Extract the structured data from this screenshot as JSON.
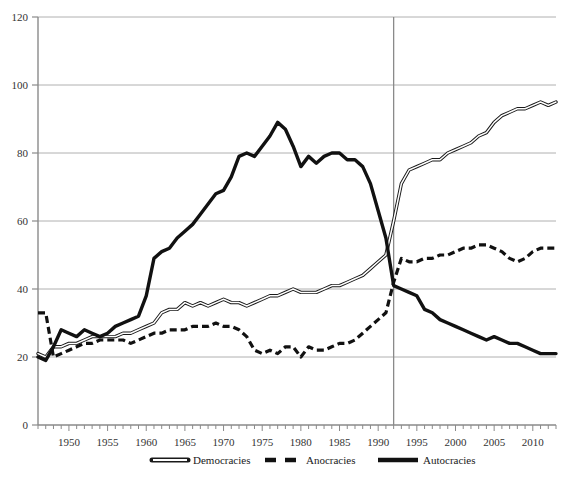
{
  "chart_data": {
    "type": "line",
    "title": "",
    "subtitle": "",
    "xlabel": "",
    "ylabel": "",
    "xlim": [
      1946,
      2013
    ],
    "ylim": [
      0,
      120
    ],
    "grid": true,
    "gridlines_y": [
      20,
      40,
      60,
      80,
      100,
      120
    ],
    "yticks": [
      0,
      20,
      40,
      60,
      80,
      100,
      120
    ],
    "ytick_labels": [
      "0",
      "20",
      "40",
      "60",
      "80",
      "100",
      "120"
    ],
    "xticks": [
      1950,
      1955,
      1960,
      1965,
      1970,
      1975,
      1980,
      1985,
      1990,
      1995,
      2000,
      2005,
      2010
    ],
    "xtick_labels": [
      "1950",
      "1955",
      "1960",
      "1965",
      "1970",
      "1975",
      "1980",
      "1985",
      "1990",
      "1995",
      "2000",
      "2005",
      "2010"
    ],
    "xtick_minor_step": 1,
    "legend_position": "bottom",
    "annotations": [
      {
        "type": "vertical-line",
        "x": 1992,
        "label": ""
      }
    ],
    "x": [
      1946,
      1947,
      1948,
      1949,
      1950,
      1951,
      1952,
      1953,
      1954,
      1955,
      1956,
      1957,
      1958,
      1959,
      1960,
      1961,
      1962,
      1963,
      1964,
      1965,
      1966,
      1967,
      1968,
      1969,
      1970,
      1971,
      1972,
      1973,
      1974,
      1975,
      1976,
      1977,
      1978,
      1979,
      1980,
      1981,
      1982,
      1983,
      1984,
      1985,
      1986,
      1987,
      1988,
      1989,
      1990,
      1991,
      1992,
      1993,
      1994,
      1995,
      1996,
      1997,
      1998,
      1999,
      2000,
      2001,
      2002,
      2003,
      2004,
      2005,
      2006,
      2007,
      2008,
      2009,
      2010,
      2011,
      2012,
      2013
    ],
    "series": [
      {
        "name": "Democracies",
        "style": "double-line",
        "color": "#555555",
        "values": [
          21,
          20,
          23,
          23,
          24,
          24,
          25,
          26,
          26,
          26,
          26,
          27,
          27,
          28,
          29,
          30,
          33,
          34,
          34,
          36,
          35,
          36,
          35,
          36,
          37,
          36,
          36,
          35,
          36,
          37,
          38,
          38,
          39,
          40,
          39,
          39,
          39,
          40,
          41,
          41,
          42,
          43,
          44,
          46,
          48,
          50,
          60,
          71,
          75,
          76,
          77,
          78,
          78,
          80,
          81,
          82,
          83,
          85,
          86,
          89,
          91,
          92,
          93,
          93,
          94,
          95,
          94,
          95
        ]
      },
      {
        "name": "Anocracies",
        "style": "dashed",
        "color": "#111111",
        "values": [
          33,
          33,
          20,
          21,
          22,
          23,
          24,
          24,
          25,
          25,
          25,
          25,
          24,
          25,
          26,
          27,
          27,
          28,
          28,
          28,
          29,
          29,
          29,
          30,
          29,
          29,
          28,
          26,
          22,
          21,
          22,
          21,
          23,
          23,
          20,
          23,
          22,
          22,
          23,
          24,
          24,
          25,
          27,
          29,
          31,
          33,
          42,
          49,
          48,
          48,
          49,
          49,
          50,
          50,
          51,
          52,
          52,
          53,
          53,
          52,
          51,
          49,
          48,
          49,
          51,
          52,
          52,
          52
        ]
      },
      {
        "name": "Autocracies",
        "style": "solid-thick",
        "color": "#111111",
        "values": [
          20,
          19,
          23,
          28,
          27,
          26,
          28,
          27,
          26,
          27,
          29,
          30,
          31,
          32,
          38,
          49,
          51,
          52,
          55,
          57,
          59,
          62,
          65,
          68,
          69,
          73,
          79,
          80,
          79,
          82,
          85,
          89,
          87,
          82,
          76,
          79,
          77,
          79,
          80,
          80,
          78,
          78,
          76,
          71,
          63,
          55,
          41,
          40,
          39,
          38,
          34,
          33,
          31,
          30,
          29,
          28,
          27,
          26,
          25,
          26,
          25,
          24,
          24,
          23,
          22,
          21,
          21,
          21
        ]
      }
    ]
  },
  "legend": {
    "items": [
      {
        "label": "Democracies",
        "style": "double-line"
      },
      {
        "label": "Anocracies",
        "style": "dashed"
      },
      {
        "label": "Autocracies",
        "style": "solid-thick"
      }
    ]
  }
}
